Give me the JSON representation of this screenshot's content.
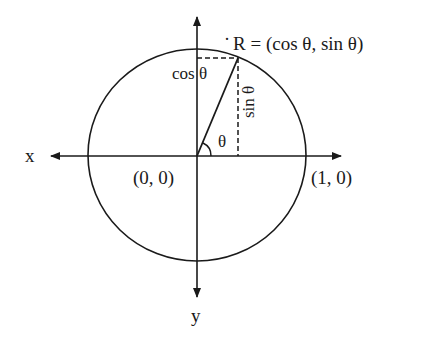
{
  "diagram": {
    "type": "unit-circle",
    "labels": {
      "x_axis": "x",
      "y_axis": "y",
      "origin": "(0, 0)",
      "unit_point": "(1, 0)",
      "point_r": "R = (cos θ, sin θ)",
      "r_dot": "·",
      "cos_label": "cos θ",
      "sin_label": "sin θ",
      "angle_label": "θ"
    },
    "colors": {
      "ink": "#1a1a1a",
      "background": "#ffffff"
    }
  }
}
